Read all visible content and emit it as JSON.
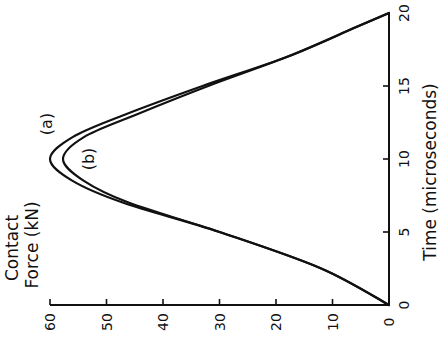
{
  "chart_data": {
    "type": "line",
    "orientation": "rotated 90 degrees clockwise (force axis along bottom, time axis along right side)",
    "title": "",
    "xlabel": "Time (microseconds)",
    "ylabel": "Contact Force (kN)",
    "ylabel_lines": [
      "Contact",
      "Force (kN)"
    ],
    "xlim": [
      0,
      20
    ],
    "ylim": [
      0,
      60
    ],
    "x_ticks": [
      0,
      5,
      10,
      15,
      20
    ],
    "y_ticks": [
      0,
      10,
      20,
      30,
      40,
      50,
      60
    ],
    "grid": false,
    "legend": "inline labels",
    "x": [
      0,
      2.5,
      5,
      7,
      8.5,
      10,
      11.5,
      13,
      15,
      17,
      19,
      20
    ],
    "series": [
      {
        "name": "(a)",
        "values": [
          0,
          12,
          30,
          47,
          56,
          60,
          56,
          47,
          33,
          18,
          6,
          0
        ]
      },
      {
        "name": "(b)",
        "values": [
          0,
          12,
          30,
          46,
          54,
          57.7,
          54,
          45,
          32,
          18,
          6,
          0
        ]
      }
    ]
  },
  "labels": {
    "time_axis": "Time (microseconds)",
    "force_line1": "Contact",
    "force_line2": "Force (kN)",
    "series_a": "(a)",
    "series_b": "(b)",
    "time_ticks": [
      "0",
      "5",
      "10",
      "15",
      "20"
    ],
    "force_ticks": [
      "0",
      "10",
      "20",
      "30",
      "40",
      "50",
      "60"
    ]
  }
}
